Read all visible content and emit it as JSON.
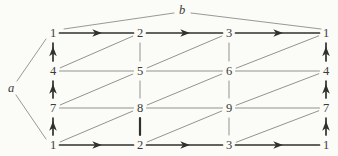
{
  "figure": {
    "width": 338,
    "height": 156,
    "background": "#fbfbf8",
    "colors": {
      "bold": "#31302d",
      "thin": "#8d8c88",
      "text": "#3b3a37"
    },
    "layout": {
      "cols_x": [
        53,
        140,
        229,
        326
      ],
      "rows_y": [
        33,
        71,
        108,
        145
      ]
    },
    "grid_numbers": [
      [
        "1",
        "2",
        "3",
        "1"
      ],
      [
        "4",
        "5",
        "6",
        "4"
      ],
      [
        "7",
        "8",
        "9",
        "7"
      ],
      [
        "1",
        "2",
        "3",
        "1"
      ]
    ],
    "edges": [
      {
        "from": [
          0,
          0
        ],
        "to": [
          1,
          0
        ],
        "style": "arrow"
      },
      {
        "from": [
          1,
          0
        ],
        "to": [
          2,
          0
        ],
        "style": "arrow"
      },
      {
        "from": [
          2,
          0
        ],
        "to": [
          3,
          0
        ],
        "style": "arrow"
      },
      {
        "from": [
          0,
          3
        ],
        "to": [
          1,
          3
        ],
        "style": "arrow"
      },
      {
        "from": [
          1,
          3
        ],
        "to": [
          2,
          3
        ],
        "style": "arrow"
      },
      {
        "from": [
          2,
          3
        ],
        "to": [
          3,
          3
        ],
        "style": "arrow"
      },
      {
        "from": [
          0,
          1
        ],
        "to": [
          0,
          0
        ],
        "style": "arrow"
      },
      {
        "from": [
          0,
          2
        ],
        "to": [
          0,
          1
        ],
        "style": "arrow"
      },
      {
        "from": [
          0,
          3
        ],
        "to": [
          0,
          2
        ],
        "style": "arrow"
      },
      {
        "from": [
          3,
          1
        ],
        "to": [
          3,
          0
        ],
        "style": "arrow"
      },
      {
        "from": [
          3,
          2
        ],
        "to": [
          3,
          1
        ],
        "style": "arrow"
      },
      {
        "from": [
          3,
          3
        ],
        "to": [
          3,
          2
        ],
        "style": "arrow"
      },
      {
        "from": [
          0,
          1
        ],
        "to": [
          1,
          1
        ],
        "style": "thin"
      },
      {
        "from": [
          1,
          1
        ],
        "to": [
          2,
          1
        ],
        "style": "thin"
      },
      {
        "from": [
          2,
          1
        ],
        "to": [
          3,
          1
        ],
        "style": "thin"
      },
      {
        "from": [
          0,
          2
        ],
        "to": [
          1,
          2
        ],
        "style": "thin"
      },
      {
        "from": [
          1,
          2
        ],
        "to": [
          2,
          2
        ],
        "style": "thin"
      },
      {
        "from": [
          2,
          2
        ],
        "to": [
          3,
          2
        ],
        "style": "thin"
      },
      {
        "from": [
          1,
          0
        ],
        "to": [
          1,
          1
        ],
        "style": "thin"
      },
      {
        "from": [
          1,
          1
        ],
        "to": [
          1,
          2
        ],
        "style": "thin"
      },
      {
        "from": [
          1,
          2
        ],
        "to": [
          1,
          3
        ],
        "style": "bold"
      },
      {
        "from": [
          2,
          0
        ],
        "to": [
          2,
          1
        ],
        "style": "thin"
      },
      {
        "from": [
          2,
          1
        ],
        "to": [
          2,
          2
        ],
        "style": "thin"
      },
      {
        "from": [
          2,
          2
        ],
        "to": [
          2,
          3
        ],
        "style": "thin"
      },
      {
        "from": [
          0,
          1
        ],
        "to": [
          1,
          0
        ],
        "style": "thin"
      },
      {
        "from": [
          1,
          1
        ],
        "to": [
          2,
          0
        ],
        "style": "thin"
      },
      {
        "from": [
          2,
          1
        ],
        "to": [
          3,
          0
        ],
        "style": "thin"
      },
      {
        "from": [
          0,
          2
        ],
        "to": [
          1,
          1
        ],
        "style": "thin"
      },
      {
        "from": [
          1,
          2
        ],
        "to": [
          2,
          1
        ],
        "style": "thin"
      },
      {
        "from": [
          2,
          2
        ],
        "to": [
          3,
          1
        ],
        "style": "thin"
      },
      {
        "from": [
          0,
          3
        ],
        "to": [
          1,
          2
        ],
        "style": "thin"
      },
      {
        "from": [
          1,
          3
        ],
        "to": [
          2,
          2
        ],
        "style": "thin"
      },
      {
        "from": [
          2,
          3
        ],
        "to": [
          3,
          2
        ],
        "style": "thin"
      }
    ],
    "generator_labels": [
      {
        "text": "b",
        "x": 182,
        "y": 10,
        "leaders": [
          {
            "x1": 174,
            "y1": 13,
            "x2": 64,
            "y2": 29
          },
          {
            "x1": 191,
            "y1": 13,
            "x2": 321,
            "y2": 29
          }
        ]
      },
      {
        "text": "a",
        "x": 11,
        "y": 88,
        "leaders": [
          {
            "x1": 17,
            "y1": 81,
            "x2": 46,
            "y2": 39
          },
          {
            "x1": 16,
            "y1": 95,
            "x2": 46,
            "y2": 139
          }
        ]
      }
    ]
  }
}
